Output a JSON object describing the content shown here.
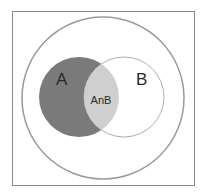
{
  "diagram": {
    "type": "venn",
    "universe_label": "",
    "sets": [
      {
        "name": "A",
        "label": "A",
        "fill": "#7a7a7a"
      },
      {
        "name": "B",
        "label": "B",
        "fill": "#ffffff"
      }
    ],
    "intersection": {
      "label": "AnB",
      "fill": "#cfcfcf"
    },
    "colors": {
      "frame": "#8a8a8a",
      "outer_circle": "#9a9a9a",
      "set_outline": "#a8a8a8"
    }
  }
}
